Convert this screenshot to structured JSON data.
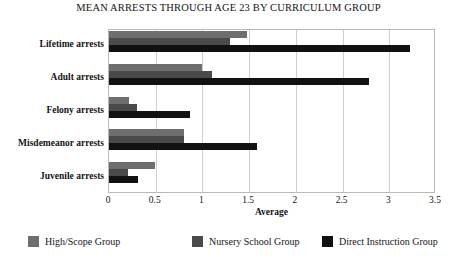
{
  "chart_data": {
    "type": "bar",
    "orientation": "horizontal",
    "title": "MEAN ARRESTS THROUGH AGE 23 BY CURRICULUM GROUP",
    "xlabel": "Average",
    "ylabel": "",
    "xlim": [
      0,
      3.5
    ],
    "xticks": [
      0,
      0.5,
      1,
      1.5,
      2,
      2.5,
      3,
      3.5
    ],
    "xtick_labels": [
      "0",
      "0.5",
      "1",
      "1.5",
      "2",
      "2.5",
      "3",
      "3.5"
    ],
    "grid": true,
    "grid_axis": "x",
    "legend_position": "bottom",
    "categories": [
      "Lifetime arrests",
      "Adult arrests",
      "Felony arrests",
      "Misdemeanor arrests",
      "Juvenile arrests"
    ],
    "series": [
      {
        "name": "High/Scope Group",
        "color": "#6e6e6e",
        "values": [
          1.48,
          1.0,
          0.21,
          0.8,
          0.49
        ]
      },
      {
        "name": "Nursery School Group",
        "color": "#4a4a4a",
        "values": [
          1.29,
          1.1,
          0.3,
          0.8,
          0.2
        ]
      },
      {
        "name": "Direct Instruction Group",
        "color": "#111111",
        "values": [
          3.22,
          2.78,
          0.87,
          1.58,
          0.31
        ]
      }
    ]
  },
  "legend": {
    "items": [
      {
        "label": "High/Scope Group",
        "color": "#6e6e6e"
      },
      {
        "label": "Nursery School Group",
        "color": "#4a4a4a"
      },
      {
        "label": "Direct Instruction Group",
        "color": "#111111"
      }
    ]
  },
  "axes": {
    "x_title": "Average"
  },
  "colors": {
    "frame": "#b9b9b9",
    "gridline": "#cfcfcf",
    "text": "#141414",
    "background": "#ffffff"
  }
}
